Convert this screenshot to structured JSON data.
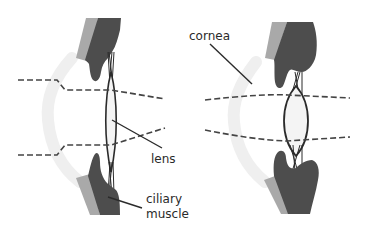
{
  "diagram": {
    "panels": [
      {
        "id": "left",
        "state": "distant focus (thin lens)"
      },
      {
        "id": "right",
        "state": "near focus (thick lens)"
      }
    ],
    "labels": {
      "cornea": "cornea",
      "lens": "lens",
      "ciliary_line1": "ciliary",
      "ciliary_line2": "muscle"
    },
    "colors": {
      "ciliary_dark": "#4d4d4d",
      "ciliary_light": "#a9a9a9",
      "cornea": "#f0f0f0",
      "lens_fill": "#f4f4f4",
      "outline": "#2b2b2b",
      "dashed_line": "#444444",
      "background": "#ffffff"
    }
  }
}
